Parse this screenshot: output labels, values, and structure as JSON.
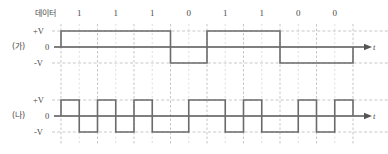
{
  "figure": {
    "type": "digital-signal-encoding-diagram",
    "data_row_label": "데이터",
    "bits": [
      "1",
      "1",
      "1",
      "0",
      "1",
      "1",
      "0",
      "0"
    ],
    "time_axis_label": "t",
    "colors": {
      "waveform": "#6b6b6b",
      "axis": "#555555",
      "grid": "#b9b9b9",
      "text": "#444444",
      "background": "#ffffff"
    },
    "rows": [
      {
        "name": "(가)",
        "encoding": "NRZ-L",
        "levels": [
          "+V",
          "0",
          "-V"
        ],
        "values": [
          "+V",
          "+V",
          "+V",
          "-V",
          "+V",
          "+V",
          "-V",
          "-V"
        ]
      },
      {
        "name": "(나)",
        "encoding": "Manchester",
        "levels": [
          "+V",
          "0",
          "-V"
        ],
        "values": [
          [
            "+V",
            "-V"
          ],
          [
            "+V",
            "-V"
          ],
          [
            "+V",
            "-V"
          ],
          [
            "-V",
            "+V"
          ],
          [
            "+V",
            "-V"
          ],
          [
            "+V",
            "-V"
          ],
          [
            "-V",
            "+V"
          ],
          [
            "-V",
            "+V"
          ]
        ]
      }
    ]
  },
  "chart_data": {
    "type": "line",
    "title": "",
    "xlabel": "t",
    "ylabel": "",
    "categories": [
      "1",
      "1",
      "1",
      "0",
      "1",
      "1",
      "0",
      "0"
    ],
    "series": [
      {
        "name": "(가)",
        "encoding": "NRZ-L",
        "values": [
          "+V",
          "+V",
          "+V",
          "-V",
          "+V",
          "+V",
          "-V",
          "-V"
        ]
      },
      {
        "name": "(나)",
        "encoding": "Manchester",
        "values": [
          [
            "+V",
            "-V"
          ],
          [
            "+V",
            "-V"
          ],
          [
            "+V",
            "-V"
          ],
          [
            "-V",
            "+V"
          ],
          [
            "+V",
            "-V"
          ],
          [
            "+V",
            "-V"
          ],
          [
            "-V",
            "+V"
          ],
          [
            "-V",
            "+V"
          ]
        ]
      }
    ],
    "ytick_labels": [
      "+V",
      "0",
      "-V"
    ],
    "ylim": [
      "-V",
      "+V"
    ],
    "grid": true,
    "legend": "none"
  }
}
